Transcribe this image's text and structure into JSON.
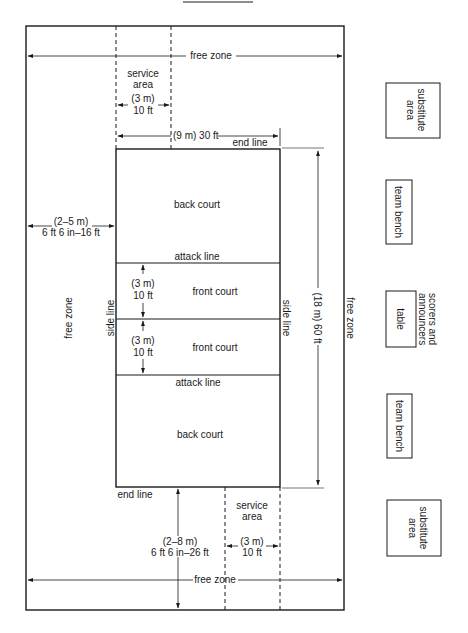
{
  "diagram": {
    "title_line": true,
    "colors": {
      "line": "#1a1a1a",
      "background": "#ffffff"
    },
    "free_zone_top": "free zone",
    "free_zone_bottom": "free zone",
    "free_zone_left": "free zone",
    "free_zone_right": "free zone",
    "service_area_top": {
      "line1": "service",
      "line2": "area",
      "metric": "(3 m)",
      "imperial": "10 ft"
    },
    "service_area_bottom": {
      "line1": "service",
      "line2": "area",
      "metric": "(3 m)",
      "imperial": "10 ft"
    },
    "court_width": "(9 m) 30 ft",
    "court_length": "(18 m) 60 ft",
    "end_line_top": "end line",
    "end_line_bottom": "end line",
    "side_line_left": "side line",
    "side_line_right": "side line",
    "back_court_top": "back court",
    "back_court_bottom": "back court",
    "attack_line_top": "attack line",
    "attack_line_bottom": "attack line",
    "front_court_top": {
      "label": "front court",
      "metric": "(3 m)",
      "imperial": "10 ft"
    },
    "front_court_bottom": {
      "label": "front court",
      "metric": "(3 m)",
      "imperial": "10 ft"
    },
    "side_free_zone_dim": {
      "metric": "(2–5 m)",
      "imperial": "6 ft 6 in–16 ft"
    },
    "end_free_zone_dim": {
      "metric": "(2–8 m)",
      "imperial": "6 ft 6 in–26 ft"
    },
    "side_boxes": {
      "substitute_top": {
        "line1": "substitute",
        "line2": "area"
      },
      "team_bench_top": "team bench",
      "table": "table",
      "scorers": {
        "line1": "scorers and",
        "line2": "announcers"
      },
      "team_bench_bottom": "team bench",
      "substitute_bottom": {
        "line1": "substitute",
        "line2": "area"
      }
    }
  }
}
